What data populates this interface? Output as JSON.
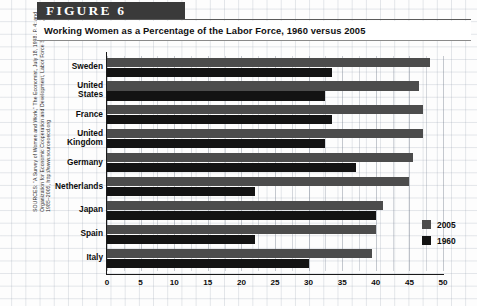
{
  "figure": {
    "banner_label": "FIGURE 6",
    "title": "Working Women as a Percentage of the Labor Force, 1960 versus 2005"
  },
  "source_note": "SOURCES: \"A Survey of Women and Work,\" The Economist, July 18, 1998, P. 4; and\nOrganization for Economic Cooperation and Development, Labor Force Statistics,\n1985–2005, http://www.sourceoecd.org",
  "legend": {
    "position": "inside-bottom-right",
    "entries": [
      {
        "label": "2005",
        "color": "#4c4c4c"
      },
      {
        "label": "1960",
        "color": "#131313"
      }
    ]
  },
  "chart_data": {
    "type": "bar",
    "orientation": "horizontal",
    "title": "Working Women as a Percentage of the Labor Force, 1960 versus 2005",
    "xlabel": "",
    "ylabel": "",
    "xlim": [
      0,
      50
    ],
    "xticks": [
      0,
      5,
      10,
      15,
      20,
      25,
      30,
      35,
      40,
      45,
      50
    ],
    "grid": true,
    "categories": [
      "Sweden",
      "United States",
      "France",
      "United Kingdom",
      "Germany",
      "Netherlands",
      "Japan",
      "Spain",
      "Italy"
    ],
    "series": [
      {
        "name": "2005",
        "color": "#4c4c4c",
        "values": [
          48.0,
          46.5,
          47.0,
          47.0,
          45.5,
          45.0,
          41.0,
          40.0,
          39.5
        ]
      },
      {
        "name": "1960",
        "color": "#131313",
        "values": [
          33.5,
          32.5,
          33.5,
          32.5,
          37.0,
          22.0,
          40.0,
          22.0,
          30.0
        ]
      }
    ]
  }
}
